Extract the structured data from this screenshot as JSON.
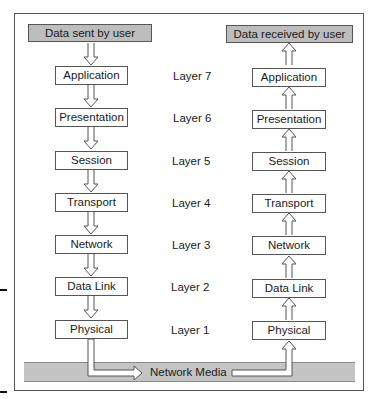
{
  "sender": {
    "header": "Data sent by user",
    "layers": [
      "Application",
      "Presentation",
      "Session",
      "Transport",
      "Network",
      "Data Link",
      "Physical"
    ]
  },
  "receiver": {
    "header": "Data received by user",
    "layers": [
      "Application",
      "Presentation",
      "Session",
      "Transport",
      "Network",
      "Data Link",
      "Physical"
    ]
  },
  "layer_labels": [
    "Layer 7",
    "Layer 6",
    "Layer 5",
    "Layer 4",
    "Layer 3",
    "Layer 2",
    "Layer 1"
  ],
  "media": {
    "label": "Network Media"
  },
  "colors": {
    "header_fill": "#bdbdbd",
    "media_fill": "#c4c4c4",
    "border": "#555555"
  }
}
